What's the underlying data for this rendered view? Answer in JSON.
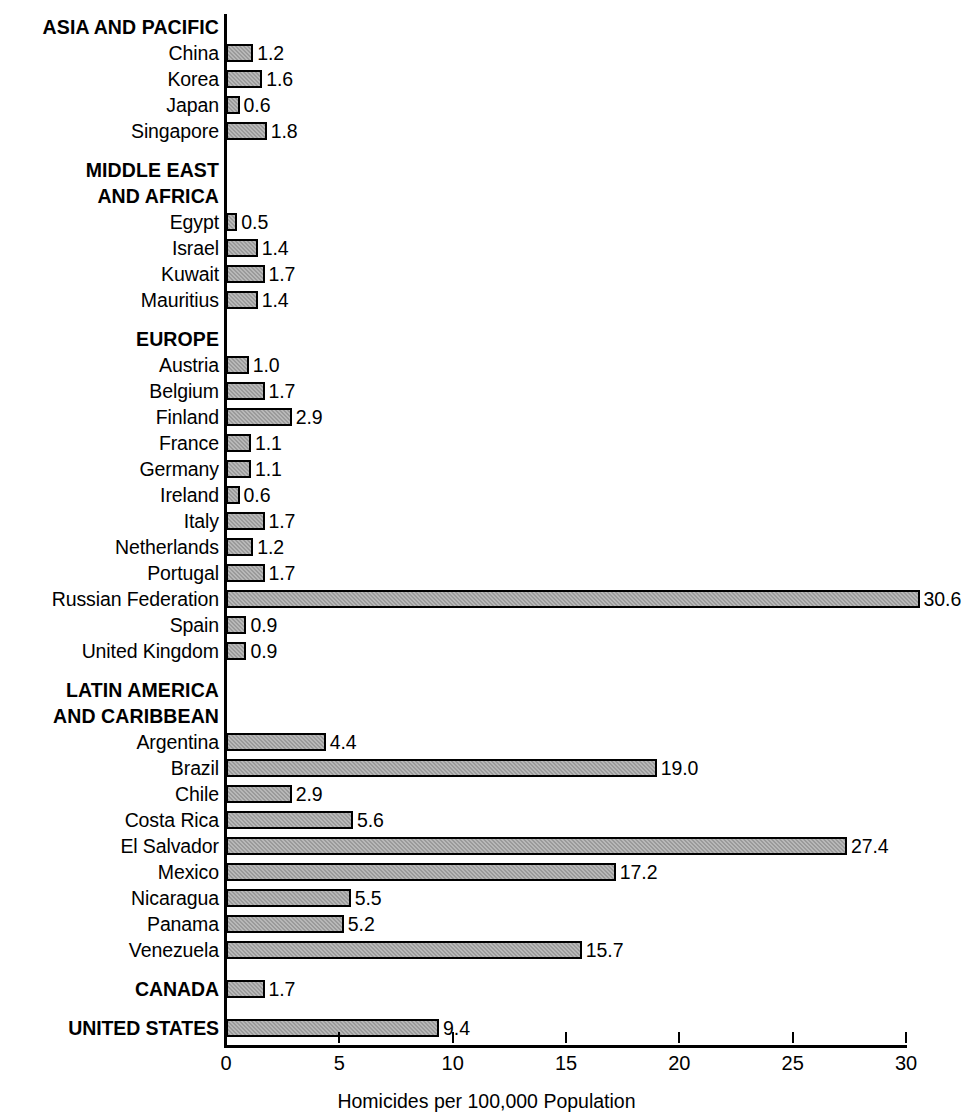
{
  "chart_data": {
    "type": "bar",
    "orientation": "horizontal",
    "title": "",
    "xlabel": "Homicides per 100,000 Population",
    "ylabel": "",
    "xlim": [
      0,
      30
    ],
    "xticks": [
      0,
      5,
      10,
      15,
      20,
      25,
      30
    ],
    "xtick_labels": [
      "0",
      "5",
      "10",
      "15",
      "20",
      "25",
      "30"
    ],
    "grid": false,
    "legend": null,
    "bar_fill_color": "#9a9a9a",
    "bar_border_color": "#000000",
    "axis_color": "#000000",
    "categories": [
      "China",
      "Korea",
      "Japan",
      "Singapore",
      "Egypt",
      "Israel",
      "Kuwait",
      "Mauritius",
      "Austria",
      "Belgium",
      "Finland",
      "France",
      "Germany",
      "Ireland",
      "Italy",
      "Netherlands",
      "Portugal",
      "Russian Federation",
      "Spain",
      "United Kingdom",
      "Argentina",
      "Brazil",
      "Chile",
      "Costa Rica",
      "El Salvador",
      "Mexico",
      "Nicaragua",
      "Panama",
      "Venezuela",
      "CANADA",
      "UNITED STATES"
    ],
    "values": [
      1.2,
      1.6,
      0.6,
      1.8,
      0.5,
      1.4,
      1.7,
      1.4,
      1.0,
      1.7,
      2.9,
      1.1,
      1.1,
      0.6,
      1.7,
      1.2,
      1.7,
      30.6,
      0.9,
      0.9,
      4.4,
      19.0,
      2.9,
      5.6,
      27.4,
      17.2,
      5.5,
      5.2,
      15.7,
      1.7,
      9.4
    ],
    "value_labels": [
      "1.2",
      "1.6",
      "0.6",
      "1.8",
      "0.5",
      "1.4",
      "1.7",
      "1.4",
      "1.0",
      "1.7",
      "2.9",
      "1.1",
      "1.1",
      "0.6",
      "1.7",
      "1.2",
      "1.7",
      "30.6",
      "0.9",
      "0.9",
      "4.4",
      "19.0",
      "2.9",
      "5.6",
      "27.4",
      "17.2",
      "5.5",
      "5.2",
      "15.7",
      "1.7",
      "9.4"
    ],
    "groups": [
      {
        "heading": [
          "ASIA AND PACIFIC"
        ],
        "items": [
          {
            "label": "China",
            "value": 1.2,
            "value_label": "1.2"
          },
          {
            "label": "Korea",
            "value": 1.6,
            "value_label": "1.6"
          },
          {
            "label": "Japan",
            "value": 0.6,
            "value_label": "0.6"
          },
          {
            "label": "Singapore",
            "value": 1.8,
            "value_label": "1.8"
          }
        ]
      },
      {
        "heading": [
          "MIDDLE EAST",
          "AND AFRICA"
        ],
        "items": [
          {
            "label": "Egypt",
            "value": 0.5,
            "value_label": "0.5"
          },
          {
            "label": "Israel",
            "value": 1.4,
            "value_label": "1.4"
          },
          {
            "label": "Kuwait",
            "value": 1.7,
            "value_label": "1.7"
          },
          {
            "label": "Mauritius",
            "value": 1.4,
            "value_label": "1.4"
          }
        ]
      },
      {
        "heading": [
          "EUROPE"
        ],
        "items": [
          {
            "label": "Austria",
            "value": 1.0,
            "value_label": "1.0"
          },
          {
            "label": "Belgium",
            "value": 1.7,
            "value_label": "1.7"
          },
          {
            "label": "Finland",
            "value": 2.9,
            "value_label": "2.9"
          },
          {
            "label": "France",
            "value": 1.1,
            "value_label": "1.1"
          },
          {
            "label": "Germany",
            "value": 1.1,
            "value_label": "1.1"
          },
          {
            "label": "Ireland",
            "value": 0.6,
            "value_label": "0.6"
          },
          {
            "label": "Italy",
            "value": 1.7,
            "value_label": "1.7"
          },
          {
            "label": "Netherlands",
            "value": 1.2,
            "value_label": "1.2"
          },
          {
            "label": "Portugal",
            "value": 1.7,
            "value_label": "1.7"
          },
          {
            "label": "Russian Federation",
            "value": 30.6,
            "value_label": "30.6"
          },
          {
            "label": "Spain",
            "value": 0.9,
            "value_label": "0.9"
          },
          {
            "label": "United Kingdom",
            "value": 0.9,
            "value_label": "0.9"
          }
        ]
      },
      {
        "heading": [
          "LATIN AMERICA",
          "AND CARIBBEAN"
        ],
        "items": [
          {
            "label": "Argentina",
            "value": 4.4,
            "value_label": "4.4"
          },
          {
            "label": "Brazil",
            "value": 19.0,
            "value_label": "19.0"
          },
          {
            "label": "Chile",
            "value": 2.9,
            "value_label": "2.9"
          },
          {
            "label": "Costa Rica",
            "value": 5.6,
            "value_label": "5.6"
          },
          {
            "label": "El Salvador",
            "value": 27.4,
            "value_label": "27.4"
          },
          {
            "label": "Mexico",
            "value": 17.2,
            "value_label": "17.2"
          },
          {
            "label": "Nicaragua",
            "value": 5.5,
            "value_label": "5.5"
          },
          {
            "label": "Panama",
            "value": 5.2,
            "value_label": "5.2"
          },
          {
            "label": "Venezuela",
            "value": 15.7,
            "value_label": "15.7"
          }
        ]
      },
      {
        "heading": [],
        "items": [
          {
            "label": "CANADA",
            "value": 1.7,
            "value_label": "1.7",
            "bold": true
          }
        ]
      },
      {
        "heading": [],
        "items": [
          {
            "label": "UNITED STATES",
            "value": 9.4,
            "value_label": "9.4",
            "bold": true
          }
        ]
      }
    ]
  }
}
